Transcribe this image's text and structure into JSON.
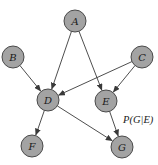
{
  "diagram": {
    "type": "directed-graph",
    "node_radius": 11,
    "colors": {
      "node_fill": "#a3a3a3",
      "node_stroke": "#4a4a4a",
      "edge": "#3a3a3a",
      "text": "#1a1a1a"
    },
    "nodes": [
      {
        "id": "A",
        "label": "A",
        "x": 75,
        "y": 21
      },
      {
        "id": "B",
        "label": "B",
        "x": 13,
        "y": 57
      },
      {
        "id": "C",
        "label": "C",
        "x": 142,
        "y": 57
      },
      {
        "id": "D",
        "label": "D",
        "x": 48,
        "y": 100
      },
      {
        "id": "E",
        "label": "E",
        "x": 106,
        "y": 101
      },
      {
        "id": "F",
        "label": "F",
        "x": 32,
        "y": 146
      },
      {
        "id": "G",
        "label": "G",
        "x": 122,
        "y": 147
      }
    ],
    "edges": [
      {
        "from": "A",
        "to": "D"
      },
      {
        "from": "A",
        "to": "E"
      },
      {
        "from": "B",
        "to": "D"
      },
      {
        "from": "C",
        "to": "D"
      },
      {
        "from": "C",
        "to": "E"
      },
      {
        "from": "D",
        "to": "F"
      },
      {
        "from": "D",
        "to": "G"
      },
      {
        "from": "E",
        "to": "G"
      }
    ],
    "annotation": {
      "text": "P(G|E)",
      "x": 123,
      "y": 123
    }
  }
}
